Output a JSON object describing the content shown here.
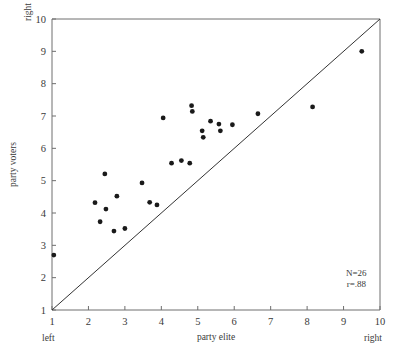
{
  "chart_data": {
    "type": "scatter",
    "title": "",
    "xlabel": "party elite",
    "ylabel": "party voters",
    "xlim": [
      1,
      10
    ],
    "ylim": [
      1,
      10
    ],
    "xticks": [
      1,
      2,
      3,
      4,
      5,
      6,
      7,
      8,
      9,
      10
    ],
    "yticks": [
      1,
      2,
      3,
      4,
      5,
      6,
      7,
      8,
      9,
      10
    ],
    "xtick_labels": [
      "1",
      "2",
      "3",
      "4",
      "5",
      "6",
      "7",
      "8",
      "9",
      "10"
    ],
    "ytick_labels": [
      "1",
      "2",
      "3",
      "4",
      "5",
      "6",
      "7",
      "8",
      "9",
      "10"
    ],
    "grid": false,
    "legend": "none",
    "axis_end_labels": {
      "x_low": "left",
      "x_high": "right",
      "y_low": "left",
      "y_high": "right"
    },
    "reference_line": {
      "type": "diagonal",
      "from": [
        1,
        1
      ],
      "to": [
        10,
        10
      ],
      "label": "y = x"
    },
    "annotations": [
      {
        "text": "N=26",
        "x": 9.35,
        "y": 2.05
      },
      {
        "text": "r=.88",
        "x": 9.35,
        "y": 1.72
      }
    ],
    "n": 26,
    "r": 0.88,
    "points": [
      {
        "x": 1.05,
        "y": 2.7
      },
      {
        "x": 2.18,
        "y": 4.32
      },
      {
        "x": 2.32,
        "y": 3.73
      },
      {
        "x": 2.45,
        "y": 5.21
      },
      {
        "x": 2.48,
        "y": 4.12
      },
      {
        "x": 2.7,
        "y": 3.44
      },
      {
        "x": 2.78,
        "y": 4.52
      },
      {
        "x": 3.0,
        "y": 3.52
      },
      {
        "x": 3.47,
        "y": 4.93
      },
      {
        "x": 3.68,
        "y": 4.33
      },
      {
        "x": 3.88,
        "y": 4.25
      },
      {
        "x": 4.05,
        "y": 6.94
      },
      {
        "x": 4.28,
        "y": 5.54
      },
      {
        "x": 4.55,
        "y": 5.62
      },
      {
        "x": 4.78,
        "y": 5.54
      },
      {
        "x": 4.83,
        "y": 7.32
      },
      {
        "x": 4.85,
        "y": 7.14
      },
      {
        "x": 5.12,
        "y": 6.54
      },
      {
        "x": 5.15,
        "y": 6.34
      },
      {
        "x": 5.35,
        "y": 6.84
      },
      {
        "x": 5.58,
        "y": 6.75
      },
      {
        "x": 5.62,
        "y": 6.54
      },
      {
        "x": 5.95,
        "y": 6.73
      },
      {
        "x": 6.65,
        "y": 7.07
      },
      {
        "x": 8.15,
        "y": 7.28
      },
      {
        "x": 9.5,
        "y": 9.0
      }
    ]
  },
  "figure": {
    "accent_color": "#1a1a1a",
    "frame_color": "#6e6e6e",
    "line_color": "#333333",
    "background": "#ffffff"
  }
}
